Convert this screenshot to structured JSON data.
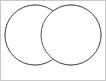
{
  "figure": {
    "title": "Venn diagram with shaded intersection",
    "canvas": {
      "width": 106,
      "height": 81,
      "background_color": "#ffffff"
    },
    "frame": {
      "visible": true,
      "stroke_color": "#c9c9c9",
      "stroke_width": 1
    }
  },
  "chart_data": {
    "type": "diagram",
    "subtype": "venn",
    "title": "Venn diagram with shaded intersection",
    "set_count": 2,
    "stroke_color": "#585858",
    "stroke_width": 1,
    "sets": [
      {
        "name": "left-set",
        "label": "",
        "center_x": 35,
        "center_y": 35,
        "radius": 30,
        "fill_color": "#ffffff",
        "shaded": false
      },
      {
        "name": "right-set",
        "label": "",
        "center_x": 71,
        "center_y": 35,
        "radius": 30,
        "fill_color": "#ffffff",
        "shaded": false
      }
    ],
    "regions": [
      {
        "name": "left-only",
        "shaded": false,
        "fill_color": "#ffffff"
      },
      {
        "name": "intersection",
        "shaded": true,
        "fill_color": "#9a9a9a"
      },
      {
        "name": "right-only",
        "shaded": false,
        "fill_color": "#ffffff"
      }
    ],
    "intersection": {
      "shaded": true,
      "fill_color": "#9a9a9a",
      "left_x": 37,
      "right_x": 69,
      "top_y": 6,
      "bottom_y": 64
    },
    "labels": [],
    "legend": null,
    "annotations": []
  }
}
